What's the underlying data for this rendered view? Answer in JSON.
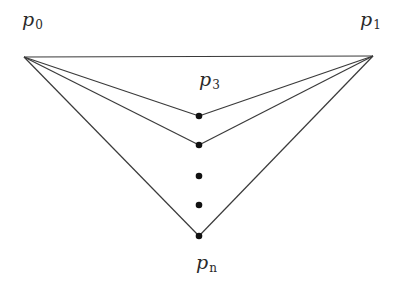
{
  "diagram": {
    "stroke_color": "#3a3a3a",
    "dot_color": "#111111",
    "points": {
      "p0": {
        "x": 24,
        "y": 57
      },
      "p1": {
        "x": 373,
        "y": 56
      }
    },
    "dots": [
      {
        "x": 199,
        "y": 116
      },
      {
        "x": 199,
        "y": 145
      },
      {
        "x": 199,
        "y": 176
      },
      {
        "x": 199,
        "y": 205
      },
      {
        "x": 199,
        "y": 236
      }
    ],
    "edges": [
      {
        "from": "p0",
        "to": "p1"
      },
      {
        "from": "p0",
        "to": 0
      },
      {
        "from": "p1",
        "to": 0
      },
      {
        "from": "p0",
        "to": 1
      },
      {
        "from": "p1",
        "to": 1
      },
      {
        "from": "p0",
        "to": 4
      },
      {
        "from": "p1",
        "to": 4
      }
    ],
    "labels": [
      {
        "id": "p0",
        "base": "p",
        "sub": "0",
        "x": 22,
        "y": 10
      },
      {
        "id": "p1",
        "base": "p",
        "sub": "1",
        "x": 372,
        "y": 10
      },
      {
        "id": "p3",
        "base": "p",
        "sub": "3",
        "x": 199,
        "y": 70
      },
      {
        "id": "pn",
        "base": "p",
        "sub": "n",
        "x": 199,
        "y": 253
      }
    ]
  }
}
